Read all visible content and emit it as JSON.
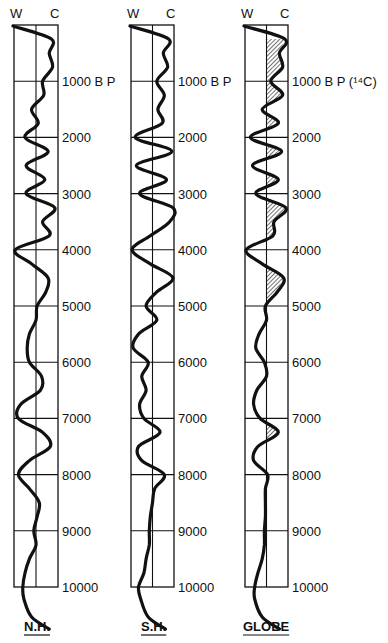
{
  "chart_data": {
    "type": "line",
    "title": "",
    "orientation": "vertical (time runs downward)",
    "y_axis": {
      "label": "years B P",
      "ticks": [
        1000,
        2000,
        3000,
        4000,
        5000,
        6000,
        7000,
        8000,
        9000,
        10000
      ],
      "tick_labels": [
        "1000 B P",
        "2000",
        "3000",
        "4000",
        "5000",
        "6000",
        "7000",
        "8000",
        "9000",
        "10000"
      ],
      "globe_first_tick_label": "1000 B P (¹⁴C)",
      "range": [
        0,
        10000
      ]
    },
    "x_axis": {
      "left_label": "W",
      "right_label": "C",
      "range": [
        -1,
        1
      ],
      "grid": "center line"
    },
    "grid": true,
    "sample_years": [
      0,
      250,
      500,
      750,
      1000,
      1250,
      1500,
      1750,
      2000,
      2250,
      2500,
      2750,
      3000,
      3250,
      3500,
      3750,
      4000,
      4250,
      4500,
      4750,
      5000,
      5250,
      5500,
      5750,
      6000,
      6250,
      6500,
      6750,
      7000,
      7250,
      7500,
      7750,
      8000,
      8250,
      8500,
      8750,
      9000,
      9250,
      9500,
      9750,
      10000
    ],
    "series": [
      {
        "name": "N.H.",
        "values": [
          -0.95,
          0.7,
          0.6,
          0.75,
          0.3,
          0.35,
          -0.2,
          0.1,
          -0.5,
          0.55,
          -0.45,
          0.4,
          -0.45,
          0.85,
          0.3,
          0.6,
          -0.95,
          -0.2,
          0.55,
          0.45,
          0.05,
          0.0,
          -0.3,
          -0.4,
          -0.3,
          0.25,
          0.2,
          -0.7,
          -0.8,
          0.3,
          0.65,
          -0.3,
          -0.8,
          -0.3,
          0.15,
          0.05,
          -0.1,
          0.0,
          -0.3,
          -0.5,
          -0.6
        ]
      },
      {
        "name": "S.H.",
        "values": [
          -0.2,
          0.75,
          0.5,
          0.7,
          0.2,
          0.55,
          0.25,
          0.45,
          -0.8,
          0.9,
          -0.75,
          0.65,
          -0.6,
          0.95,
          0.8,
          -0.1,
          -0.95,
          -0.1,
          0.95,
          0.2,
          -0.3,
          0.2,
          -0.65,
          -0.9,
          -0.2,
          -0.5,
          -0.3,
          -0.6,
          -0.4,
          0.35,
          -0.65,
          -0.5,
          0.55,
          0.1,
          0.0,
          -0.1,
          -0.15,
          -0.15,
          -0.3,
          -0.4,
          -0.65
        ]
      },
      {
        "name": "GLOBE",
        "values": [
          -0.95,
          0.85,
          0.6,
          0.75,
          0.2,
          0.75,
          -0.2,
          0.55,
          -0.75,
          0.7,
          -0.65,
          0.55,
          -0.5,
          0.9,
          0.35,
          0.3,
          -0.95,
          -0.2,
          0.8,
          0.5,
          -0.05,
          0.0,
          -0.35,
          -0.5,
          -0.1,
          0.0,
          -0.45,
          -0.6,
          -0.3,
          0.55,
          -0.4,
          -0.6,
          0.05,
          -0.05,
          -0.05,
          -0.05,
          -0.1,
          -0.1,
          -0.2,
          -0.4,
          -0.55
        ]
      }
    ],
    "shaded_regions_globe": "area between curve and center line where curve lies on the C (cold) side above ~3000 B P and at ~4500, ~7400 B P is hatched",
    "panel_labels": [
      "N.H.",
      "S.H.",
      "GLOBE"
    ]
  },
  "panels": [
    {
      "label": "N.H.",
      "w": "W",
      "c": "C",
      "first_tick": "1000 B P"
    },
    {
      "label": "S.H.",
      "w": "W",
      "c": "C",
      "first_tick": "1000 B P"
    },
    {
      "label": "GLOBE",
      "w": "W",
      "c": "C",
      "first_tick": "1000 B P (¹⁴C)"
    }
  ],
  "ticks": [
    "2000",
    "3000",
    "4000",
    "5000",
    "6000",
    "7000",
    "8000",
    "9000",
    "10000"
  ]
}
